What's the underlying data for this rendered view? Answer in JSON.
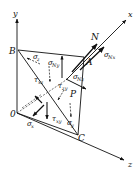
{
  "diagram": {
    "type": "tetrahedron stress element",
    "axes": {
      "x": {
        "label": "x"
      },
      "y": {
        "label": "y"
      },
      "z": {
        "label": "z"
      }
    },
    "points": {
      "O": {
        "label": "0"
      },
      "A": {
        "label": "A"
      },
      "B": {
        "label": "B"
      },
      "C": {
        "label": "C"
      },
      "P": {
        "label": "P"
      }
    },
    "normal": {
      "label": "N"
    },
    "stresses": {
      "sigma_x": {
        "symbol": "σ",
        "sub": "x"
      },
      "sigma_y": {
        "symbol": "σ",
        "sub": "y"
      },
      "sigma_z": {
        "symbol": "σ",
        "sub": "z"
      },
      "tau_xz": {
        "symbol": "τ",
        "sub": "xz"
      },
      "tau_zy": {
        "symbol": "τ",
        "sub": "zy"
      },
      "tau_xy": {
        "symbol": "τ",
        "sub": "xy"
      },
      "sigma_Nx": {
        "symbol": "σ",
        "sub": "Nx"
      },
      "sigma_Ny": {
        "symbol": "σ",
        "sub": "Ny"
      },
      "sigma_Nz": {
        "symbol": "σ",
        "sub": "Nz"
      }
    },
    "colors": {
      "ink": "#111111",
      "background": "#ffffff"
    }
  }
}
